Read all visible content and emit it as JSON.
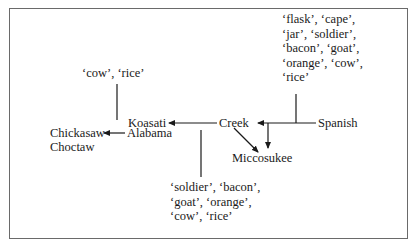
{
  "diagram": {
    "nodes": {
      "spanish": "Spanish",
      "creek": "Creek",
      "miccosukee": "Miccosukee",
      "koasati": "Koasati",
      "alabama": "Alabama",
      "chickasaw": "Chickasaw",
      "choctaw": "Choctaw"
    },
    "word_lists": {
      "spanish_words": "‘flask’, ‘cape’,\n‘jar’, ‘soldier’,\n‘bacon’, ‘goat’,\n‘orange’, ‘cow’,\n‘rice’",
      "creek_words": "‘soldier’, ‘bacon’,\n‘goat’, ‘orange’,\n‘cow’, ‘rice’",
      "alabama_words": "‘cow’, ‘rice’"
    },
    "edges": [
      {
        "from": "Spanish",
        "to": "Creek"
      },
      {
        "from": "Spanish",
        "to": "Miccosukee"
      },
      {
        "from": "Creek",
        "to": "Miccosukee"
      },
      {
        "from": "Creek",
        "to": "Koasati"
      },
      {
        "from": "Alabama",
        "to": "Chickasaw"
      }
    ],
    "colors": {
      "ink": "#1a1a1a",
      "frame": "#6a6a6a",
      "background": "#ffffff"
    }
  }
}
